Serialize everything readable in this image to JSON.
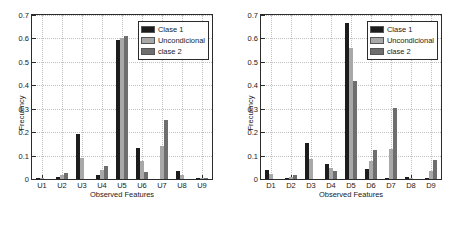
{
  "figure": {
    "panels": [
      {
        "id": "panel-left",
        "ylabel": "Frecuency",
        "xlabel": "Observed Features",
        "ytick_labels": [
          "0",
          "0.1",
          "0.2",
          "0.3",
          "0.4",
          "0.5",
          "0.6",
          "0.7"
        ],
        "legend": {
          "entries": [
            {
              "label": "Clase 1",
              "color": "#1c1c1c"
            },
            {
              "label": "Uncondicional",
              "color": "#a8a8a8"
            },
            {
              "label": "clase 2",
              "color": "#6e6e6e"
            }
          ]
        }
      },
      {
        "id": "panel-right",
        "ylabel": "Frecuency",
        "xlabel": "Observed Features",
        "ytick_labels": [
          "0",
          "0.1",
          "0.2",
          "0.3",
          "0.4",
          "0.5",
          "0.6",
          "0.7"
        ],
        "legend": {
          "entries": [
            {
              "label": "Clase 1",
              "color": "#1c1c1c"
            },
            {
              "label": "Uncondicional",
              "color": "#a8a8a8"
            },
            {
              "label": "clase 2",
              "color": "#6e6e6e"
            }
          ]
        }
      }
    ]
  },
  "chart_data": [
    {
      "type": "bar",
      "title": "",
      "xlabel": "Observed Features",
      "ylabel": "Frecuency",
      "categories": [
        "U1",
        "U2",
        "U3",
        "U4",
        "U5",
        "U6",
        "U7",
        "U8",
        "U9"
      ],
      "ylim": [
        0,
        0.7
      ],
      "yticks": [
        0,
        0.1,
        0.2,
        0.3,
        0.4,
        0.5,
        0.6,
        0.7
      ],
      "grid": true,
      "legend_position": "upper right",
      "series": [
        {
          "name": "Clase 1",
          "color": "#1c1c1c",
          "values": [
            0.004,
            0.008,
            0.193,
            0.016,
            0.595,
            0.133,
            0.0,
            0.035,
            0.002
          ]
        },
        {
          "name": "Uncondicional",
          "color": "#a8a8a8",
          "values": [
            0.003,
            0.016,
            0.088,
            0.04,
            0.603,
            0.076,
            0.139,
            0.016,
            0.004
          ]
        },
        {
          "name": "clase 2",
          "color": "#6e6e6e",
          "values": [
            0.0,
            0.027,
            0.0,
            0.057,
            0.609,
            0.03,
            0.254,
            0.0,
            0.006
          ]
        }
      ]
    },
    {
      "type": "bar",
      "title": "",
      "xlabel": "Observed Features",
      "ylabel": "Frecuency",
      "categories": [
        "D1",
        "D2",
        "D3",
        "D4",
        "D5",
        "D6",
        "D7",
        "D8",
        "D9"
      ],
      "ylim": [
        0,
        0.7
      ],
      "yticks": [
        0,
        0.1,
        0.2,
        0.3,
        0.4,
        0.5,
        0.6,
        0.7
      ],
      "grid": true,
      "legend_position": "upper right",
      "series": [
        {
          "name": "Clase 1",
          "color": "#1c1c1c",
          "values": [
            0.04,
            0.006,
            0.152,
            0.065,
            0.668,
            0.043,
            0.001,
            0.008,
            0.002
          ]
        },
        {
          "name": "Uncondicional",
          "color": "#a8a8a8",
          "values": [
            0.022,
            0.01,
            0.087,
            0.047,
            0.561,
            0.078,
            0.129,
            0.004,
            0.035
          ]
        },
        {
          "name": "clase 2",
          "color": "#6e6e6e",
          "values": [
            0.0,
            0.018,
            0.0,
            0.033,
            0.419,
            0.123,
            0.304,
            0.0,
            0.082
          ]
        }
      ]
    }
  ]
}
